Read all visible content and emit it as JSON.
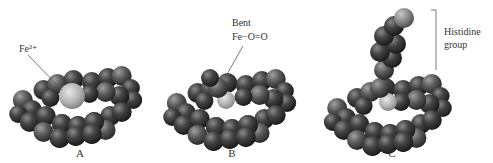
{
  "figure": {
    "panels": [
      {
        "id": "A",
        "label": "A",
        "callout": {
          "lines": [
            "Fe²⁺"
          ],
          "target": "iron-ion"
        }
      },
      {
        "id": "B",
        "label": "B",
        "callout": {
          "lines": [
            "Bent",
            "Fe−O=O"
          ],
          "target": "bound-oxygen"
        }
      },
      {
        "id": "C",
        "label": "C",
        "callout": {
          "lines": [
            "Histidine",
            "group"
          ],
          "target": "histidine-group"
        }
      }
    ],
    "colors": {
      "atom_dark": "#3a3a3a",
      "atom_mid": "#5c5c5c",
      "iron": "#b8b8b8",
      "oxygen": "#6e6e6e",
      "histidine_top": "#8a8a8a",
      "line": "#555555",
      "text": "#333333"
    }
  }
}
